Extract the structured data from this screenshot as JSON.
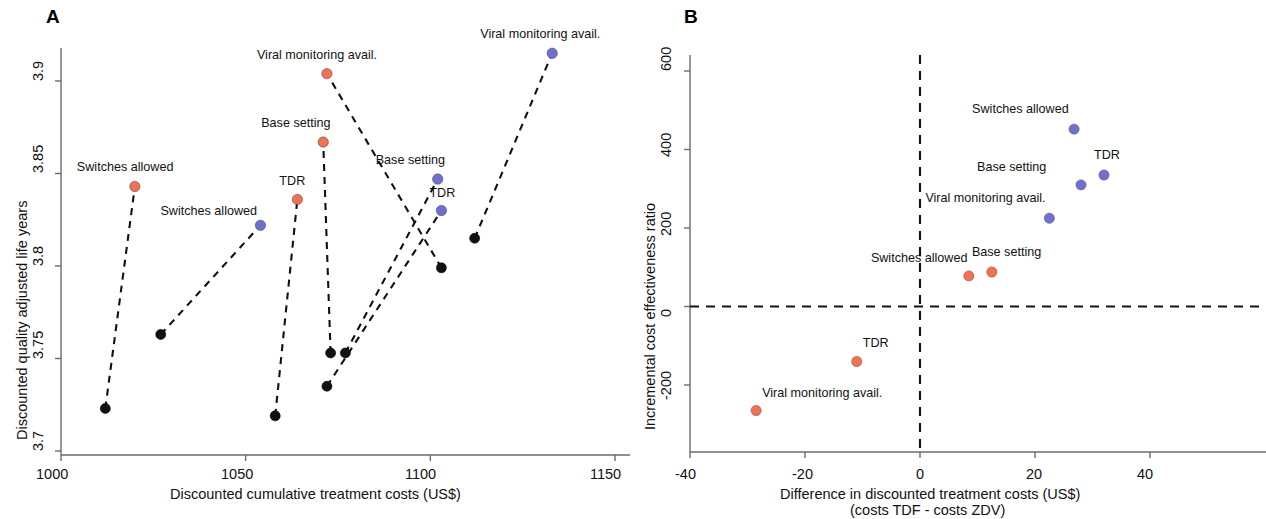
{
  "figure": {
    "panels": [
      {
        "letter": "A",
        "xlabel": "Discounted cumulative treatment costs (US$)",
        "ylabel": "Discounted quality adjusted life years",
        "xticks": [
          "1000",
          "1050",
          "1100",
          "1150"
        ],
        "yticks": [
          "3.9",
          "3.85",
          "3.8",
          "3.75",
          "3.7"
        ]
      },
      {
        "letter": "B",
        "xlabel": "Difference in discounted treatment costs (US$)",
        "xlabel2": "(costs TDF - costs ZDV)",
        "ylabel": "Incremental cost effectiveness ratio",
        "xticks": [
          "-40",
          "-20",
          "0",
          "20",
          "40"
        ],
        "yticks": [
          "600",
          "400",
          "200",
          "0",
          "-200"
        ]
      }
    ],
    "colors": {
      "orange": "#ee7253",
      "blue": "#6f6fd0",
      "black": "#111111",
      "axis": "#6b6b6b"
    }
  },
  "chart_data": [
    {
      "type": "scatter",
      "panel": "A",
      "title": "A",
      "xlabel": "Discounted cumulative treatment costs (US$)",
      "ylabel": "Discounted quality adjusted life years",
      "xlim": [
        1000,
        1150
      ],
      "ylim": [
        3.7,
        3.92
      ],
      "xticks": [
        1000,
        1050,
        1100,
        1150
      ],
      "yticks": [
        3.7,
        3.75,
        3.8,
        3.85,
        3.9
      ],
      "grid": false,
      "legend": "none",
      "series": [
        {
          "name": "TDF regimen scenarios",
          "color": "#ee7253",
          "points": [
            {
              "label": "Switches allowed",
              "x": 1020,
              "y": 3.843,
              "label_dx": -58,
              "label_dy": -15
            },
            {
              "label": "Base setting",
              "x": 1071,
              "y": 3.867,
              "label_dx": -62,
              "label_dy": -15
            },
            {
              "label": "TDR",
              "x": 1064,
              "y": 3.836,
              "label_dx": -18,
              "label_dy": -14
            },
            {
              "label": "Viral monitoring avail.",
              "x": 1072,
              "y": 3.904,
              "label_dx": -70,
              "label_dy": -15
            }
          ]
        },
        {
          "name": "TDF regimen scenarios (alt)",
          "color": "#6f6fd0",
          "points": [
            {
              "label": "Switches allowed",
              "x": 1054,
              "y": 3.822,
              "label_dx": -100,
              "label_dy": -10
            },
            {
              "label": "Base setting",
              "x": 1102,
              "y": 3.847,
              "label_dx": -62,
              "label_dy": -15
            },
            {
              "label": "TDR",
              "x": 1103,
              "y": 3.83,
              "label_dx": -12,
              "label_dy": -14
            },
            {
              "label": "Viral monitoring avail.",
              "x": 1133,
              "y": 3.915,
              "label_dx": -72,
              "label_dy": -15
            }
          ]
        },
        {
          "name": "ZDV comparator",
          "color": "#111111",
          "points": [
            {
              "label": "",
              "x": 1012,
              "y": 3.723
            },
            {
              "label": "",
              "x": 1027,
              "y": 3.763
            },
            {
              "label": "",
              "x": 1058,
              "y": 3.719
            },
            {
              "label": "",
              "x": 1072,
              "y": 3.735
            },
            {
              "label": "",
              "x": 1073,
              "y": 3.753
            },
            {
              "label": "",
              "x": 1077,
              "y": 3.753
            },
            {
              "label": "",
              "x": 1103,
              "y": 3.799
            },
            {
              "label": "",
              "x": 1112,
              "y": 3.815
            }
          ]
        }
      ],
      "connectors": [
        {
          "from": [
            1012,
            3.723
          ],
          "to": [
            1020,
            3.843
          ]
        },
        {
          "from": [
            1027,
            3.763
          ],
          "to": [
            1054,
            3.822
          ]
        },
        {
          "from": [
            1058,
            3.719
          ],
          "to": [
            1064,
            3.836
          ]
        },
        {
          "from": [
            1073,
            3.753
          ],
          "to": [
            1071,
            3.867
          ]
        },
        {
          "from": [
            1072,
            3.735
          ],
          "to": [
            1103,
            3.83
          ]
        },
        {
          "from": [
            1077,
            3.753
          ],
          "to": [
            1102,
            3.847
          ]
        },
        {
          "from": [
            1103,
            3.799
          ],
          "to": [
            1072,
            3.904
          ]
        },
        {
          "from": [
            1112,
            3.815
          ],
          "to": [
            1133,
            3.915
          ]
        }
      ]
    },
    {
      "type": "scatter",
      "panel": "B",
      "title": "B",
      "xlabel": "Difference in discounted treatment costs (US$)",
      "xlabel2": "(costs TDF - costs ZDV)",
      "ylabel": "Incremental cost effectiveness ratio",
      "xlim": [
        -40,
        40
      ],
      "ylim": [
        -290,
        640
      ],
      "xticks": [
        -40,
        -20,
        0,
        20,
        40
      ],
      "yticks": [
        -200,
        0,
        200,
        400,
        600
      ],
      "grid": false,
      "legend": "none",
      "reference_lines": [
        {
          "type": "horizontal",
          "value": 0,
          "style": "dashed"
        },
        {
          "type": "vertical",
          "value": 0,
          "style": "dashed"
        }
      ],
      "series": [
        {
          "name": "Orange scenarios",
          "color": "#ee7253",
          "points": [
            {
              "label": "Switches allowed",
              "x": 8.5,
              "y": 78,
              "label_dx": -98,
              "label_dy": -14
            },
            {
              "label": "Base setting",
              "x": 12.5,
              "y": 88,
              "label_dx": -20,
              "label_dy": -16
            },
            {
              "label": "TDR",
              "x": -11,
              "y": -140,
              "label_dx": 6,
              "label_dy": -14
            },
            {
              "label": "Viral monitoring avail.",
              "x": -28.5,
              "y": -265,
              "label_dx": 6,
              "label_dy": -14
            }
          ]
        },
        {
          "name": "Blue scenarios",
          "color": "#6f6fd0",
          "points": [
            {
              "label": "Switches allowed",
              "x": 26.8,
              "y": 452,
              "label_dx": -102,
              "label_dy": -16
            },
            {
              "label": "TDR",
              "x": 32,
              "y": 335,
              "label_dx": -10,
              "label_dy": -16
            },
            {
              "label": "Base setting",
              "x": 28,
              "y": 310,
              "label_dx": -104,
              "label_dy": -14
            },
            {
              "label": "Viral monitoring avail.",
              "x": 22.5,
              "y": 225,
              "label_dx": -124,
              "label_dy": -16
            }
          ]
        }
      ]
    }
  ]
}
